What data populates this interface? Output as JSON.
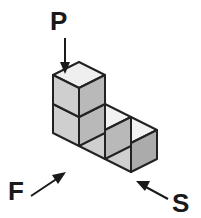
{
  "figure": {
    "background_color": "#ffffff",
    "width": 201,
    "height": 218,
    "edge_color": "#222222",
    "label_color": "#1a1a1a",
    "face_colors": {
      "top_light": "#efefef",
      "top_bright": "#f5f5f5",
      "left": "#cfcfcf",
      "right": "#b9b9b9",
      "right_dark": "#ababab"
    },
    "labels": [
      {
        "id": "P",
        "text": "P",
        "x": 50,
        "y": 30,
        "meaning": "downward force applied to top of upper cube",
        "arrow": "down-arrow"
      },
      {
        "id": "F",
        "text": "F",
        "x": 8,
        "y": 199,
        "meaning": "force directed up-right toward front lower-left cube",
        "arrow": "up-right-arrow"
      },
      {
        "id": "S",
        "text": "S",
        "x": 172,
        "y": 210,
        "meaning": "force directed up-left toward right end cube",
        "arrow": "up-left-arrow"
      }
    ],
    "arrows": [
      {
        "id": "arrow-P",
        "name": "down-arrow",
        "from": [
          65,
          40
        ],
        "to": [
          65,
          74
        ],
        "direction": "down"
      },
      {
        "id": "arrow-F",
        "name": "up-right-arrow",
        "from": [
          32,
          194
        ],
        "to": [
          64,
          173
        ],
        "direction": "up-right"
      },
      {
        "id": "arrow-S",
        "name": "up-left-arrow",
        "from": [
          168,
          199
        ],
        "to": [
          139,
          183
        ],
        "direction": "up-left"
      }
    ],
    "cubes": [
      {
        "id": "cube-upper-left",
        "position": "top of left column",
        "row": "upper",
        "column": 1
      },
      {
        "id": "cube-lower-left",
        "position": "bottom of left column",
        "row": "lower",
        "column": 1
      },
      {
        "id": "cube-lower-middle",
        "position": "middle of bottom row",
        "row": "lower",
        "column": 2
      },
      {
        "id": "cube-lower-right",
        "position": "right end of bottom row",
        "row": "lower",
        "column": 3
      }
    ],
    "shape_description": "Four unit cubes in an L arrangement: three in a bottom row extending right, with one stacked on the leftmost."
  }
}
